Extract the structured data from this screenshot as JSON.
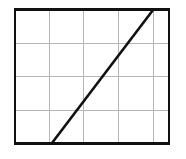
{
  "figure": {
    "title": "",
    "background_color": "#ffffff",
    "width": 186,
    "height": 159
  },
  "plot_area": {
    "x": 15,
    "y": 9.5,
    "width": 154,
    "height": 134,
    "border_color": "#111111",
    "border_width": 2.6,
    "fill_color": "#ffffff"
  },
  "grid": {
    "color": "#b7b7b7",
    "width": 1,
    "columns": 5,
    "rows": 4,
    "x_positions": [
      49,
      83.8,
      118.6,
      153.4
    ],
    "y_positions": [
      43,
      76.5,
      110
    ]
  },
  "chart_data": {
    "type": "line",
    "title": "",
    "subtitle": "",
    "xlabel": "",
    "ylabel": "",
    "grid": true,
    "legend": null,
    "axis_tick_labels": {
      "x": [],
      "y": []
    },
    "xlim": [
      0,
      5
    ],
    "ylim": [
      0,
      4
    ],
    "series": [
      {
        "name": "line",
        "color": "#111111",
        "line_width": 2.6,
        "x": [
          1.2,
          4.0
        ],
        "y": [
          0.0,
          4.0
        ],
        "pixel_points": [
          {
            "x": 52,
            "y": 143
          },
          {
            "x": 153,
            "y": 10
          }
        ]
      }
    ]
  }
}
